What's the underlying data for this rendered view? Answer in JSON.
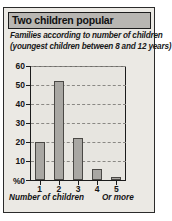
{
  "card": {
    "title": "Two children popular",
    "subtitle_line1": "Families according to number of children",
    "subtitle_line2": "(youngest children between 8 and 12 years)",
    "caption_left": "Number of children",
    "caption_right": "Or more",
    "percent_label": "%",
    "colors": {
      "card_background": "#ebe9e4",
      "titlebar_background": "#b8b6b2",
      "border": "#2b2b2b",
      "bar_fill": "#a9a7a3",
      "bar_outline": "#4a4845",
      "gridline": "#8a8884",
      "axis": "#1b1b1b",
      "text": "#141414"
    }
  },
  "chart_data": {
    "type": "bar",
    "title": "Two children popular",
    "subtitle": "Families according to number of children (youngest children between 8 and 12 years)",
    "categories": [
      "1",
      "2",
      "3",
      "4",
      "5"
    ],
    "values": [
      20,
      52,
      22,
      6,
      1.5
    ],
    "xlabel": "Number of children",
    "ylabel": "%",
    "ylim": [
      0,
      60
    ],
    "yticks": [
      0,
      10,
      20,
      30,
      40,
      50,
      60
    ],
    "ytick_labels": [
      "0",
      "10",
      "20",
      "30",
      "40",
      "50",
      "60"
    ],
    "grid": true,
    "grid_style": "dashed-horizontal",
    "legend": false,
    "annotations": [
      "Or more"
    ]
  }
}
